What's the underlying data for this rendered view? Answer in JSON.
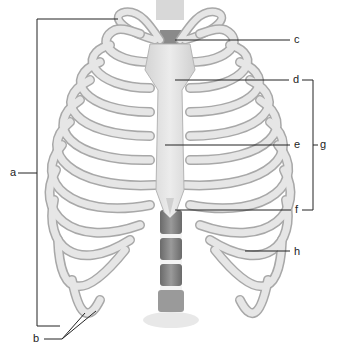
{
  "diagram": {
    "colors": {
      "bone": "#e4e4e4",
      "bone_edge": "#a8a8a8",
      "cartilage": "#f1f1f1",
      "vertebra": "#7e7e7e",
      "leader": "#222222"
    },
    "labels": [
      {
        "id": "a",
        "text": "a",
        "x": 10,
        "y": 167
      },
      {
        "id": "b",
        "text": "b",
        "x": 33,
        "y": 333
      },
      {
        "id": "c",
        "text": "c",
        "x": 294,
        "y": 34
      },
      {
        "id": "d",
        "text": "d",
        "x": 293,
        "y": 74
      },
      {
        "id": "e",
        "text": "e",
        "x": 294,
        "y": 139
      },
      {
        "id": "f",
        "text": "f",
        "x": 295,
        "y": 204
      },
      {
        "id": "g",
        "text": "g",
        "x": 320,
        "y": 139
      },
      {
        "id": "h",
        "text": "h",
        "x": 294,
        "y": 246
      }
    ]
  }
}
